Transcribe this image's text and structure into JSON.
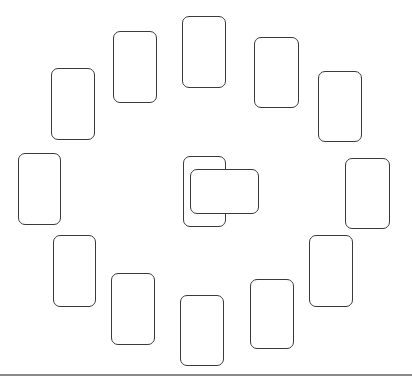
{
  "diagram": {
    "type": "card-spread",
    "layout": "circle-of-twelve-with-crossed-center",
    "stroke_color": "#3a3a3a",
    "background": "#ffffff",
    "baseline_color": "#8a8a8a",
    "cards": [
      {
        "id": "pos-top",
        "x": 182,
        "y": 16,
        "w": 44,
        "h": 72
      },
      {
        "id": "pos-top-right-1",
        "x": 254,
        "y": 37,
        "w": 45,
        "h": 71
      },
      {
        "id": "pos-top-right-2",
        "x": 318,
        "y": 71,
        "w": 44,
        "h": 71
      },
      {
        "id": "pos-right",
        "x": 345,
        "y": 158,
        "w": 45,
        "h": 71
      },
      {
        "id": "pos-bottom-right-1",
        "x": 309,
        "y": 235,
        "w": 44,
        "h": 72
      },
      {
        "id": "pos-bottom-right-2",
        "x": 250,
        "y": 279,
        "w": 44,
        "h": 70
      },
      {
        "id": "pos-bottom",
        "x": 180,
        "y": 295,
        "w": 44,
        "h": 71
      },
      {
        "id": "pos-bottom-left-2",
        "x": 111,
        "y": 273,
        "w": 44,
        "h": 72
      },
      {
        "id": "pos-bottom-left-1",
        "x": 53,
        "y": 235,
        "w": 43,
        "h": 72
      },
      {
        "id": "pos-left",
        "x": 18,
        "y": 153,
        "w": 43,
        "h": 72
      },
      {
        "id": "pos-top-left-2",
        "x": 51,
        "y": 68,
        "w": 44,
        "h": 72
      },
      {
        "id": "pos-top-left-1",
        "x": 113,
        "y": 31,
        "w": 44,
        "h": 72
      }
    ],
    "center": {
      "vertical": {
        "id": "center-card",
        "x": 183,
        "y": 156,
        "w": 43,
        "h": 71
      },
      "horizontal": {
        "id": "crossing-card",
        "x": 190,
        "y": 169,
        "w": 69,
        "h": 45
      }
    }
  }
}
